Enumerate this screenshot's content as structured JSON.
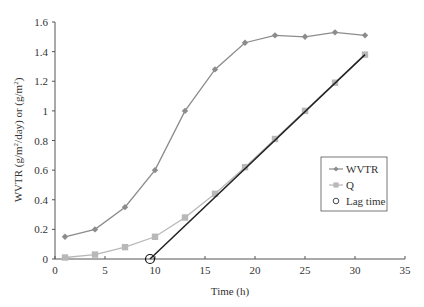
{
  "chart_data": {
    "type": "line",
    "title": "",
    "xlabel": "Time (h)",
    "ylabel": "WVTR (g/m²/day) or (g/m²)",
    "xlim": [
      0,
      35
    ],
    "ylim": [
      0,
      1.6
    ],
    "xticks": [
      0,
      5,
      10,
      15,
      20,
      25,
      30,
      35
    ],
    "yticks": [
      0,
      0.2,
      0.4,
      0.6,
      0.8,
      1,
      1.2,
      1.4,
      1.6
    ],
    "ytick_labels": [
      "0",
      "0.2",
      "0.4",
      "0.6",
      "0.8",
      "1",
      "1.2",
      "1.4",
      "1.6"
    ],
    "grid": false,
    "legend_position": "right-middle",
    "x": [
      1,
      4,
      7,
      10,
      13,
      16,
      19,
      22,
      25,
      28,
      31
    ],
    "series": [
      {
        "name": "WVTR",
        "marker": "diamond",
        "color": "#8c8c8c",
        "values": [
          0.15,
          0.2,
          0.35,
          0.6,
          1.0,
          1.28,
          1.46,
          1.51,
          1.5,
          1.53,
          1.51
        ]
      },
      {
        "name": "Q",
        "marker": "square",
        "color": "#b8b8b8",
        "values": [
          0.01,
          0.03,
          0.08,
          0.15,
          0.28,
          0.44,
          0.62,
          0.81,
          1.0,
          1.19,
          1.38
        ]
      }
    ],
    "lag_time": {
      "name": "Lag time",
      "marker": "circle-open",
      "x": 9.5,
      "y": 0
    },
    "regression_line": {
      "color": "#222222",
      "from": [
        9.5,
        0
      ],
      "to": [
        31,
        1.38
      ]
    }
  },
  "legend": {
    "items": [
      {
        "label": "WVTR"
      },
      {
        "label": "Q"
      },
      {
        "label": "Lag time"
      }
    ]
  },
  "axes": {
    "xlabel": "Time (h)",
    "ylabel_main": "WVTR (g/m",
    "ylabel_sup1": "2",
    "ylabel_mid": "/day) or (g/m",
    "ylabel_sup2": "2",
    "ylabel_end": ")"
  }
}
